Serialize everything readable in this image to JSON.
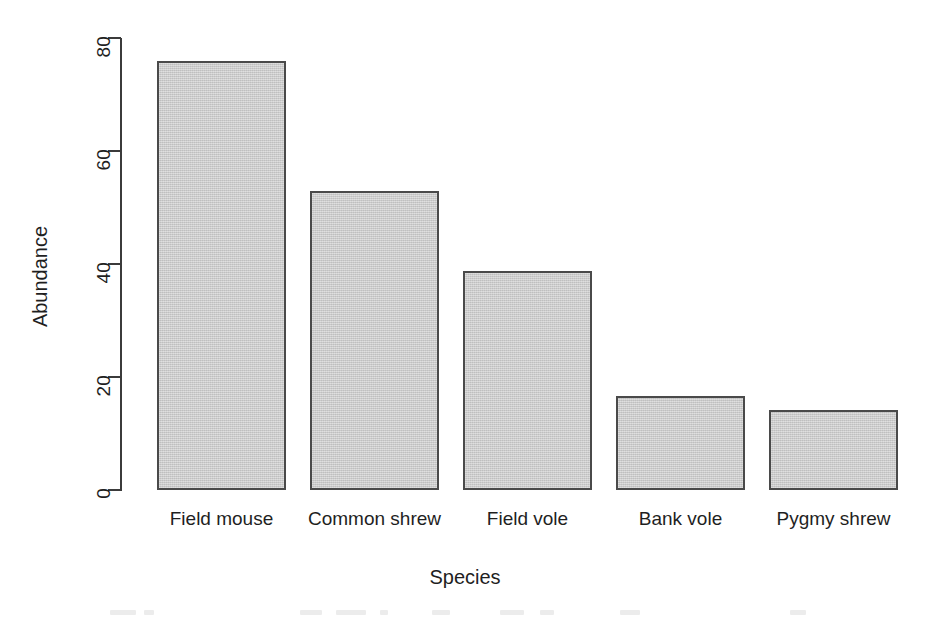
{
  "chart_data": {
    "type": "bar",
    "title": "",
    "xlabel": "Species",
    "ylabel": "Abundance",
    "categories": [
      "Field mouse",
      "Common shrew",
      "Field vole",
      "Bank vole",
      "Pygmy shrew"
    ],
    "values": [
      76,
      53,
      38.7,
      16.7,
      14.2
    ],
    "yticks": [
      0,
      20,
      40,
      60,
      80
    ],
    "ytick_labels": [
      "0",
      "20",
      "40",
      "60",
      "80"
    ],
    "ylim": [
      0,
      80
    ],
    "grid": false,
    "legend": false,
    "bar_fill_color": "#c9c9c9",
    "bar_border_color": "#4a4a4a",
    "axis_color": "#3b3b3b",
    "background_color": "#ffffff",
    "ytick_label_rotation": "90",
    "ylabel_rotation": "90"
  },
  "figure": {
    "axis_y": {
      "name": "Abundance"
    },
    "axis_x": {
      "name": "Species"
    }
  }
}
